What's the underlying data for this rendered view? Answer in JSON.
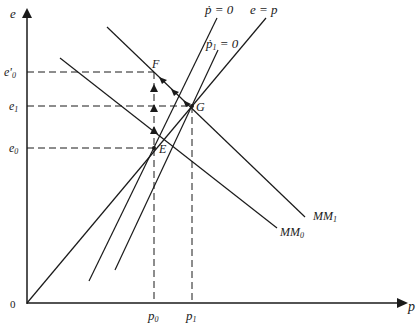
{
  "diagram": {
    "axes": {
      "y_label": "e",
      "x_label": "p",
      "origin_label": "0"
    },
    "y_ticks": [
      {
        "label": "e'",
        "sub": "0",
        "name": "e-prime-0"
      },
      {
        "label": "e",
        "sub": "1",
        "name": "e-1"
      },
      {
        "label": "e",
        "sub": "0",
        "name": "e-0"
      }
    ],
    "x_ticks": [
      {
        "label": "p",
        "sub": "0"
      },
      {
        "label": "p",
        "sub": "1"
      }
    ],
    "curves": {
      "pdot_zero": {
        "label": "ṗ = 0"
      },
      "pdot1_zero": {
        "label": "ṗ",
        "sub": "1",
        "suffix": " = 0"
      },
      "e_eq_p": {
        "label": "e = p"
      },
      "mm0": {
        "label": "MM",
        "sub": "0"
      },
      "mm1": {
        "label": "MM",
        "sub": "1"
      }
    },
    "points": {
      "E": "E",
      "F": "F",
      "G": "G"
    }
  }
}
